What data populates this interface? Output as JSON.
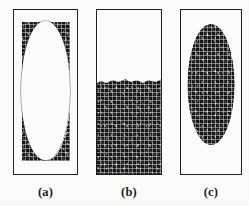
{
  "figure": {
    "background_color": "#fcfcfb",
    "ink_color": "#191617",
    "panel_count": 3,
    "panels": [
      {
        "id": "a",
        "caption": "(a)",
        "frame": {
          "x": 13,
          "y": 9,
          "width": 65,
          "height": 166
        },
        "fill": "granular-texture",
        "fill_color": "#191617",
        "feature": "white-elliptical-void",
        "feature_color": "#fdfdfc",
        "void_ellipse": {
          "cx_pct": 50,
          "cy_pct": 49,
          "width_pct": 74,
          "height_pct": 84
        },
        "fill_fraction": 0.52
      },
      {
        "id": "b",
        "caption": "(b)",
        "frame": {
          "x": 96,
          "y": 9,
          "width": 66,
          "height": 166
        },
        "fill": "granular-texture",
        "fill_color": "#191617",
        "feature": "lower-region-filled",
        "fill_top_y": 104,
        "fill_height_pct": 59,
        "fill_fraction": 0.59,
        "surface": "slightly-irregular-horizontal"
      },
      {
        "id": "c",
        "caption": "(c)",
        "frame": {
          "x": 180,
          "y": 9,
          "width": 62,
          "height": 166
        },
        "fill": "empty-white",
        "fill_color": "#fdfdfc",
        "feature": "granular-elliptical-blob",
        "feature_color": "#191617",
        "blob_ellipse": {
          "cx_pct": 50,
          "cy_pct": 45,
          "width_pct": 76,
          "height_pct": 73
        },
        "fill_fraction": 0.44
      }
    ]
  }
}
